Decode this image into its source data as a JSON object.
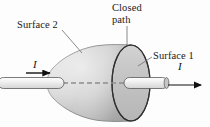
{
  "figure": {
    "type": "physics-diagram",
    "background_color": "#fdfdfd",
    "labels": {
      "surface_2": "Surface 2",
      "closed_path": "Closed\npath",
      "surface_1": "Surface 1",
      "current_left": "I",
      "current_right": "I"
    },
    "colors": {
      "outline": "#4a4a4a",
      "surface_fill_light": "#e8e8e8",
      "surface_fill_mid": "#c9c9c9",
      "surface_fill_dark": "#a8a8a8",
      "wire_fill": "#efefef",
      "wire_outline": "#555555",
      "dashed_line": "#8d8d8d",
      "arrow": "#111111",
      "leader": "#666666",
      "text": "#1a1a1a"
    },
    "elements": {
      "balloon_surface": "surface-2-balloon",
      "disk_ellipse": "surface-1-disk",
      "closed_path_ring": "closed-path-ellipse",
      "wire_left": "wire-segment-left",
      "wire_right": "wire-segment-right",
      "axis_dashes": "wire-axis-dashed-line",
      "arrow_left": "current-arrow-left",
      "arrow_right": "current-arrow-right",
      "leader_surface2": "leader-line-surface-2",
      "leader_closed_path": "leader-line-closed-path",
      "leader_surface1": "leader-line-surface-1"
    },
    "geometry": {
      "ellipse_center_x": 131,
      "ellipse_center_y": 83,
      "ellipse_rx": 19,
      "ellipse_ry": 38,
      "balloon_tip_x": 47,
      "wire_axis_y": 83
    }
  }
}
